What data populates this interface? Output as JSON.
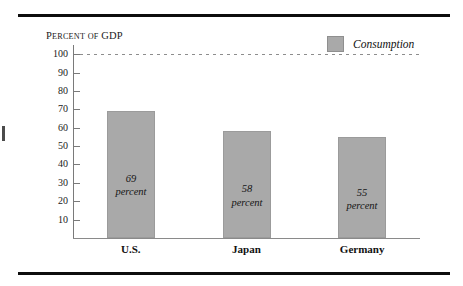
{
  "chart_data": {
    "type": "bar",
    "title": "",
    "subtitle": "",
    "ylabel": "Percent of GDP",
    "ylabel_parts": {
      "lead": "P",
      "rest_small": "ERCENT",
      "of_small": "OF",
      "gdp": "GDP"
    },
    "xlabel": "",
    "categories": [
      "U.S.",
      "Japan",
      "Germany"
    ],
    "values": [
      69,
      58,
      55
    ],
    "value_labels": [
      "69",
      "58",
      "55"
    ],
    "value_unit": "percent",
    "series": [
      {
        "name": "Consumption",
        "values": [
          69,
          58,
          55
        ]
      }
    ],
    "ylim": [
      0,
      105
    ],
    "yticks": [
      10,
      20,
      30,
      40,
      50,
      60,
      70,
      80,
      90,
      100
    ],
    "ytick_labels": [
      "10",
      "20",
      "30",
      "40",
      "50",
      "60",
      "70",
      "80",
      "90",
      "100"
    ],
    "grid": false,
    "reference_lines": [
      {
        "value": 100,
        "style": "dashed",
        "color": "#8d8d8d"
      }
    ],
    "legend": {
      "position": "top-right",
      "entries": [
        {
          "label": "Consumption",
          "color": "#a9a9a9"
        }
      ]
    },
    "colors": {
      "bar_fill": "#a9a9a9",
      "bar_edge": "#9b9b9b",
      "axis": "#7a7a7a",
      "text": "#111111",
      "rule": "#0d0d0d"
    }
  }
}
